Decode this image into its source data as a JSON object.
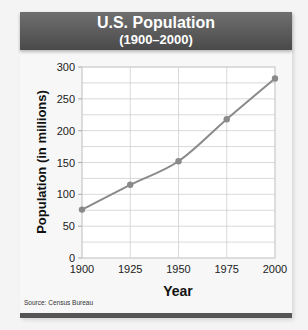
{
  "header": {
    "title": "U.S. Population",
    "subtitle": "(1900–2000)"
  },
  "source": "Source: Census Bureau",
  "colors": {
    "title_bar": "#555555",
    "line": "#8a8a8a",
    "marker": "#8a8a8a",
    "grid": "#cccccc",
    "plot_bg": "#ffffff"
  },
  "chart_data": {
    "type": "line",
    "title": "U.S. Population",
    "subtitle": "(1900–2000)",
    "xlabel": "Year",
    "ylabel": "Population (in millions)",
    "x": [
      1900,
      1925,
      1950,
      1975,
      2000
    ],
    "series": [
      {
        "name": "U.S. Population",
        "values": [
          76,
          115,
          152,
          218,
          282
        ]
      }
    ],
    "x_ticks": [
      "1900",
      "1925",
      "1950",
      "1975",
      "2000"
    ],
    "y_ticks": [
      "0",
      "50",
      "100",
      "150",
      "200",
      "250",
      "300"
    ],
    "xlim": [
      1900,
      2000
    ],
    "ylim": [
      0,
      300
    ],
    "grid": true,
    "minor_y_grid_step": 25,
    "legend": "none",
    "source": "Source: Census Bureau"
  }
}
